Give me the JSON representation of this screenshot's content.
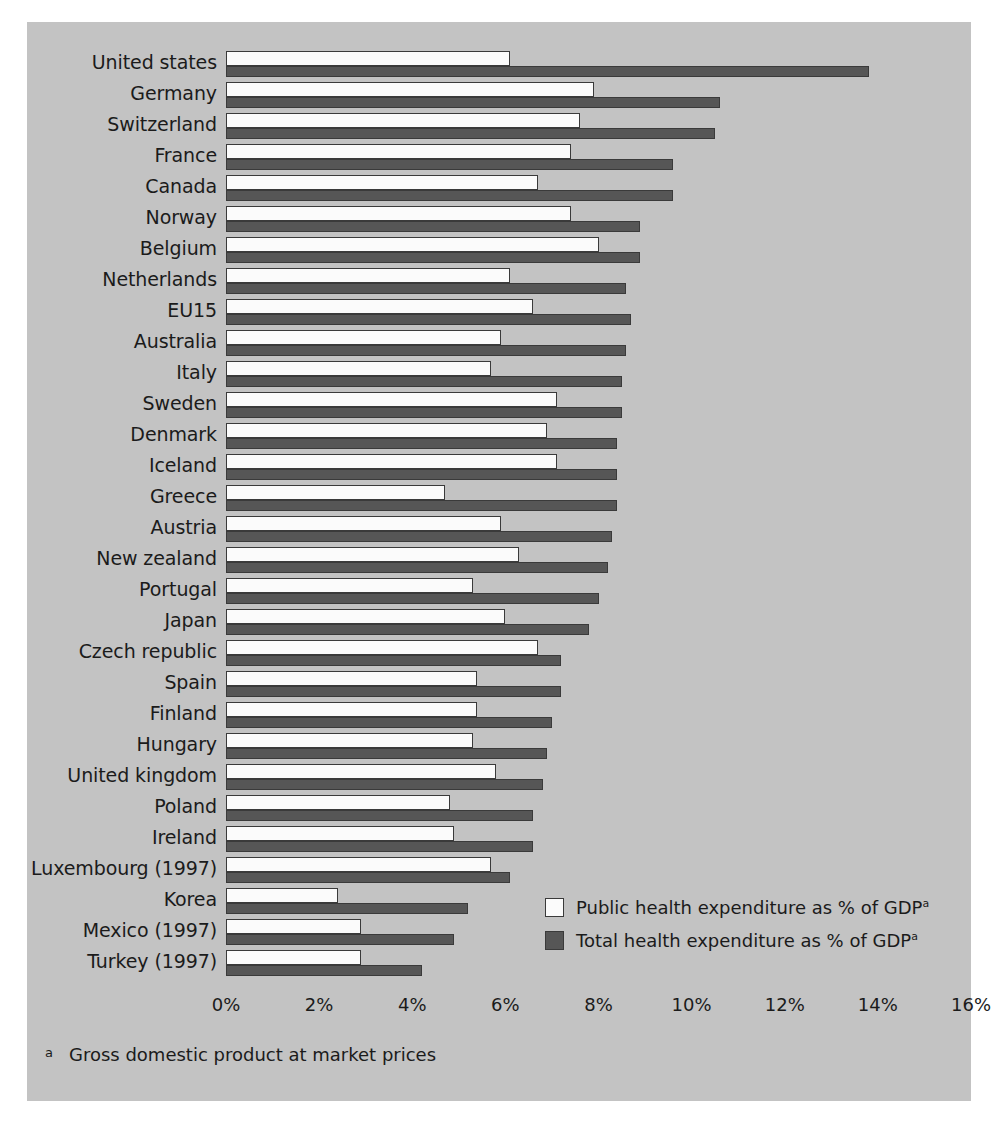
{
  "chart_data": {
    "type": "bar",
    "orientation": "horizontal",
    "title": "",
    "subtitle": "",
    "xlabel": "",
    "ylabel": "",
    "xlim": [
      0,
      16
    ],
    "x_tick_labels": [
      "0%",
      "2%",
      "4%",
      "6%",
      "8%",
      "10%",
      "12%",
      "14%",
      "16%"
    ],
    "x_tick_values": [
      0,
      2,
      4,
      6,
      8,
      10,
      12,
      14,
      16
    ],
    "grid": false,
    "legend_position": "inside-bottom-right",
    "categories": [
      "United states",
      "Germany",
      "Switzerland",
      "France",
      "Canada",
      "Norway",
      "Belgium",
      "Netherlands",
      "EU15",
      "Australia",
      "Italy",
      "Sweden",
      "Denmark",
      "Iceland",
      "Greece",
      "Austria",
      "New zealand",
      "Portugal",
      "Japan",
      "Czech republic",
      "Spain",
      "Finland",
      "Hungary",
      "United kingdom",
      "Poland",
      "Ireland",
      "Luxembourg (1997)",
      "Korea",
      "Mexico (1997)",
      "Turkey (1997)"
    ],
    "series": [
      {
        "name": "Public health expenditure as % of GDP",
        "color": "#fbfbfb",
        "values": [
          6.1,
          7.9,
          7.6,
          7.4,
          6.7,
          7.4,
          8.0,
          6.1,
          6.6,
          5.9,
          5.7,
          7.1,
          6.9,
          7.1,
          4.7,
          5.9,
          6.3,
          5.3,
          6.0,
          6.7,
          5.4,
          5.4,
          5.3,
          5.8,
          4.8,
          4.9,
          5.7,
          2.4,
          2.9,
          2.9
        ]
      },
      {
        "name": "Total health expenditure as % of GDP",
        "color": "#565656",
        "values": [
          13.8,
          10.6,
          10.5,
          9.6,
          9.6,
          8.9,
          8.9,
          8.6,
          8.7,
          8.6,
          8.5,
          8.5,
          8.4,
          8.4,
          8.4,
          8.3,
          8.2,
          8.0,
          7.8,
          7.2,
          7.2,
          7.0,
          6.9,
          6.8,
          6.6,
          6.6,
          6.1,
          5.2,
          4.9,
          4.2
        ]
      }
    ],
    "footnote_marker": "a",
    "footnote": "Gross domestic product at market prices",
    "legend_superscript": "a",
    "colors": {
      "panel_background": "#c3c3c3",
      "page_background": "#ffffff",
      "bar_outline": "#3a3a3a",
      "public_fill": "#fbfbfb",
      "total_fill": "#565656",
      "text": "#1b1b1b"
    }
  }
}
